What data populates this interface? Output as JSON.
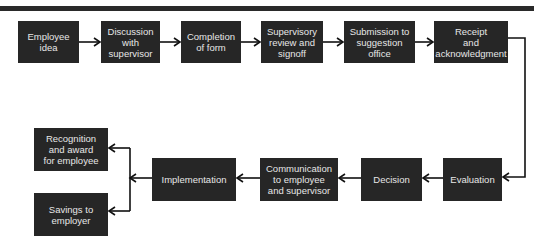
{
  "diagram": {
    "type": "flowchart",
    "title": "",
    "nodes": [
      {
        "id": "n1",
        "label": "Employee\nidea"
      },
      {
        "id": "n2",
        "label": "Discussion\nwith\nsupervisor"
      },
      {
        "id": "n3",
        "label": "Completion\nof form"
      },
      {
        "id": "n4",
        "label": "Supervisory\nreview and\nsignoff"
      },
      {
        "id": "n5",
        "label": "Submission to\nsuggestion\noffice"
      },
      {
        "id": "n6",
        "label": "Receipt\nand\nacknowledgment"
      },
      {
        "id": "n7",
        "label": "Evaluation"
      },
      {
        "id": "n8",
        "label": "Decision"
      },
      {
        "id": "n9",
        "label": "Communication\nto employee\nand supervisor"
      },
      {
        "id": "n10",
        "label": "Implementation"
      },
      {
        "id": "n11",
        "label": "Recognition\nand award\nfor employee"
      },
      {
        "id": "n12",
        "label": "Savings to\nemployer"
      }
    ],
    "edges": [
      [
        "n1",
        "n2"
      ],
      [
        "n2",
        "n3"
      ],
      [
        "n3",
        "n4"
      ],
      [
        "n4",
        "n5"
      ],
      [
        "n5",
        "n6"
      ],
      [
        "n6",
        "n7"
      ],
      [
        "n7",
        "n8"
      ],
      [
        "n8",
        "n9"
      ],
      [
        "n9",
        "n10"
      ],
      [
        "n10",
        "n11"
      ],
      [
        "n10",
        "n12"
      ]
    ],
    "colors": {
      "box_fill": "#262626",
      "box_text": "#e6e6e6",
      "line": "#111111",
      "background": "#ffffff"
    }
  }
}
